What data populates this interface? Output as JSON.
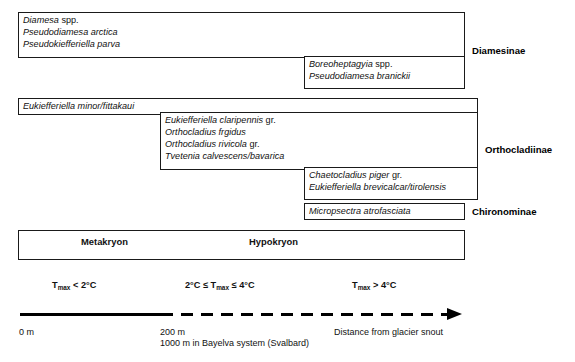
{
  "groups": [
    {
      "subfamily": "Diamesinae",
      "boxes": [
        {
          "id": "diamesinae-upper",
          "taxa": [
            {
              "italic": "Diamesa",
              "roman": " spp."
            },
            {
              "italic": "Pseudodiamesa arctica",
              "roman": ""
            },
            {
              "italic": "Pseudokiefferiella parva",
              "roman": ""
            }
          ]
        },
        {
          "id": "diamesinae-lower",
          "taxa": [
            {
              "italic": "Boreoheptagyia",
              "roman": " spp."
            },
            {
              "italic": "Pseudodiamesa branickii",
              "roman": ""
            }
          ]
        }
      ]
    },
    {
      "subfamily": "Orthocladiinae",
      "boxes": [
        {
          "id": "orthocladiinae-upper",
          "taxa": [
            {
              "italic": "Eukiefferiella minor/fittakaui",
              "roman": ""
            }
          ]
        },
        {
          "id": "orthocladiinae-middle",
          "taxa": [
            {
              "italic": "Eukiefferiella claripennis",
              "roman": " gr."
            },
            {
              "italic": "Orthocladius frgidus",
              "roman": ""
            },
            {
              "italic": "Orthocladius rivicola",
              "roman": " gr."
            },
            {
              "italic": "Tvetenia calvescens/bavarica",
              "roman": ""
            }
          ]
        },
        {
          "id": "orthocladiinae-lower",
          "taxa": [
            {
              "italic": "Chaetocladius piger",
              "roman": " gr."
            },
            {
              "italic": "Eukiefferiella brevicalcar/tirolensis",
              "roman": ""
            }
          ]
        }
      ]
    },
    {
      "subfamily": "Chironominae",
      "boxes": [
        {
          "id": "chironominae-box",
          "taxa": [
            {
              "italic": "Micropsectra atrofasciata",
              "roman": ""
            }
          ]
        }
      ]
    }
  ],
  "zonation": {
    "zones": [
      {
        "label": "Metakryon"
      },
      {
        "label": "Hypokryon"
      }
    ]
  },
  "temperature_labels": [
    {
      "prefix": "T",
      "sub": "max",
      "suffix": " < 2°C",
      "full": "Tmax < 2°C"
    },
    {
      "prefix": "2°C ≤ T",
      "sub": "max",
      "suffix": " ≤ 4°C",
      "full": "2°C ≤ Tmax ≤ 4°C"
    },
    {
      "prefix": "T",
      "sub": "max",
      "suffix": " > 4°C",
      "full": "Tmax > 4°C"
    }
  ],
  "axis": {
    "tick_zero": "0 m",
    "tick_two_hundred": "200 m",
    "tick_two_hundred_note": "1000 m in Bayelva system (Svalbard)",
    "axis_title": "Distance from glacier snout"
  },
  "colors": {
    "line": "#1a1a1a",
    "text": "#111111",
    "background": "#ffffff"
  }
}
